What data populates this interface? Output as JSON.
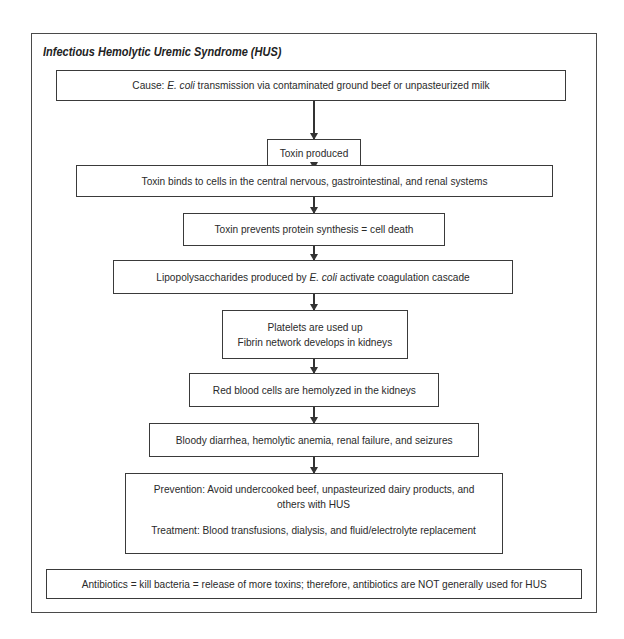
{
  "diagram": {
    "title": "Infectious Hemolytic Uremic Syndrome (HUS)",
    "steps": [
      {
        "id": "cause",
        "pre": "Cause: ",
        "italic": "E. coli",
        "post": " transmission via contaminated ground beef or unpasteurized milk"
      },
      {
        "id": "toxin-produced",
        "text": "Toxin produced"
      },
      {
        "id": "toxin-binds",
        "text": "Toxin binds to cells in the central nervous, gastrointestinal, and renal systems"
      },
      {
        "id": "toxin-prevents",
        "text": "Toxin prevents protein synthesis = cell death"
      },
      {
        "id": "lipopolysaccharides",
        "pre": "Lipopolysaccharides produced by ",
        "italic": "E. coli",
        "post": " activate coagulation cascade"
      },
      {
        "id": "platelets",
        "lines": [
          "Platelets are used up",
          "Fibrin network develops in kidneys"
        ]
      },
      {
        "id": "red-blood-cells",
        "text": "Red blood cells are hemolyzed in the kidneys"
      },
      {
        "id": "symptoms",
        "text": "Bloody diarrhea, hemolytic anemia, renal failure, and seizures"
      },
      {
        "id": "prevention-treatment",
        "prevention": [
          "Prevention: Avoid undercooked beef, unpasteurized dairy products, and",
          "others with HUS"
        ],
        "treatment": "Treatment: Blood transfusions, dialysis, and fluid/electrolyte replacement"
      }
    ],
    "note": "Antibiotics = kill bacteria = release of more toxins; therefore, antibiotics are NOT generally used for HUS"
  }
}
